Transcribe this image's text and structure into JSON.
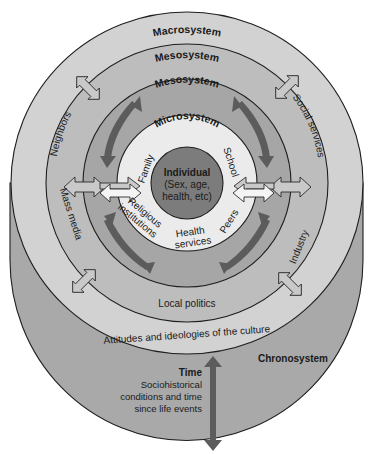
{
  "diagram": {
    "colors": {
      "chronosystem_fill": "#a9a9a9",
      "macrosystem_fill": "#d2d2d2",
      "exosystem_fill": "#bdbdbd",
      "mesosystem_fill": "#a6a6a6",
      "microsystem_fill": "#ebebeb",
      "individual_fill": "#7c7c7c",
      "dark_arrow": "#5c5c5c"
    },
    "layers": {
      "macrosystem": {
        "label": "Macrosystem",
        "bottom_text": "Attitudes and ideologies of the culture"
      },
      "exosystem": {
        "label": "Mesosystem",
        "items": [
          "Neighbors",
          "Social services",
          "Mass media",
          "Industry",
          "Local politics"
        ]
      },
      "mesosystem": {
        "label": "Mesosystem"
      },
      "microsystem": {
        "label": "Microsystem",
        "items": [
          "Family",
          "School",
          "Religious institutions",
          "Peers",
          "Health services"
        ],
        "religious_line1": "Religious",
        "religious_line2": "institutions",
        "health_line1": "Health",
        "health_line2": "services"
      },
      "individual": {
        "title": "Individual",
        "line1": "(Sex, age,",
        "line2": "health, etc)"
      },
      "chronosystem": {
        "label": "Chronosystem",
        "time_title": "Time",
        "time_line1": "Sociohistorical",
        "time_line2": "conditions and time",
        "time_line3": "since life events"
      }
    }
  }
}
